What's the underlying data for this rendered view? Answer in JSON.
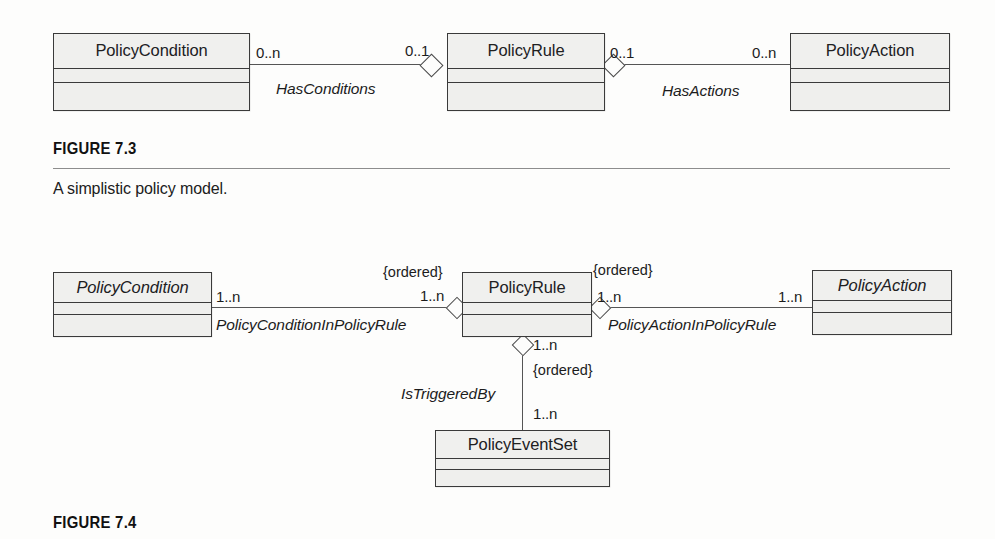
{
  "page": {
    "background_color": "#fdfdfc",
    "ink_color": "#1c1c1c"
  },
  "figures": [
    {
      "id": "figure-7-3",
      "label": "FIGURE 7.3",
      "caption": "A simplistic policy model.",
      "diagram_type": "uml-class-diagram",
      "classes": [
        {
          "name": "PolicyCondition",
          "abstract": false,
          "compartments": 3
        },
        {
          "name": "PolicyRule",
          "abstract": false,
          "compartments": 3
        },
        {
          "name": "PolicyAction",
          "abstract": false,
          "compartments": 3
        }
      ],
      "associations": [
        {
          "name": "HasConditions",
          "from": "PolicyCondition",
          "to": "PolicyRule",
          "from_multiplicity": "0..n",
          "to_multiplicity": "0..1",
          "aggregation_end": "PolicyRule",
          "aggregation": "shared"
        },
        {
          "name": "HasActions",
          "from": "PolicyRule",
          "to": "PolicyAction",
          "from_multiplicity": "0..1",
          "to_multiplicity": "0..n",
          "aggregation_end": "PolicyRule",
          "aggregation": "shared"
        }
      ]
    },
    {
      "id": "figure-7-4",
      "label": "FIGURE 7.4",
      "caption": "",
      "diagram_type": "uml-class-diagram",
      "classes": [
        {
          "name": "PolicyCondition",
          "abstract": true,
          "compartments": 3
        },
        {
          "name": "PolicyRule",
          "abstract": false,
          "compartments": 3
        },
        {
          "name": "PolicyAction",
          "abstract": true,
          "compartments": 3
        },
        {
          "name": "PolicyEventSet",
          "abstract": false,
          "compartments": 3
        }
      ],
      "associations": [
        {
          "name": "PolicyConditionInPolicyRule",
          "from": "PolicyCondition",
          "to": "PolicyRule",
          "from_multiplicity": "1..n",
          "to_multiplicity": "1..n",
          "constraint": "{ordered}",
          "aggregation_end": "PolicyRule",
          "aggregation": "shared"
        },
        {
          "name": "PolicyActionInPolicyRule",
          "from": "PolicyRule",
          "to": "PolicyAction",
          "from_multiplicity": "1..n",
          "to_multiplicity": "1..n",
          "constraint": "{ordered}",
          "aggregation_end": "PolicyRule",
          "aggregation": "shared"
        },
        {
          "name": "IsTriggeredBy",
          "from": "PolicyRule",
          "to": "PolicyEventSet",
          "from_multiplicity": "1..n",
          "to_multiplicity": "1..n",
          "constraint": "{ordered}",
          "aggregation_end": "PolicyRule",
          "aggregation": "shared"
        }
      ]
    }
  ],
  "f73": {
    "cls_condition": "PolicyCondition",
    "cls_rule": "PolicyRule",
    "cls_action": "PolicyAction",
    "mult_cond_left": "0..n",
    "mult_rule_left": "0..1",
    "mult_rule_right": "0..1",
    "mult_action_right": "0..n",
    "assoc_conditions": "HasConditions",
    "assoc_actions": "HasActions",
    "fig_label": "FIGURE 7.3",
    "fig_caption": "A simplistic policy model."
  },
  "f74": {
    "cls_condition": "PolicyCondition",
    "cls_rule": "PolicyRule",
    "cls_action": "PolicyAction",
    "cls_eventset": "PolicyEventSet",
    "mult_cond": "1..n",
    "mult_rule_left": "1..n",
    "mult_rule_right": "1..n",
    "mult_action": "1..n",
    "mult_rule_bottom": "1..n",
    "mult_eventset": "1..n",
    "ordered_left": "{ordered}",
    "ordered_right": "{ordered}",
    "ordered_bottom": "{ordered}",
    "assoc_cond": "PolicyConditionInPolicyRule",
    "assoc_action": "PolicyActionInPolicyRule",
    "assoc_trigger": "IsTriggeredBy",
    "fig_label": "FIGURE 7.4"
  }
}
